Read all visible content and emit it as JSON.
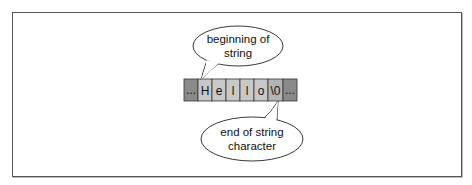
{
  "diagram": {
    "array_cells": [
      {
        "label": "...",
        "kind": "outside",
        "fill": "#8a8a8a"
      },
      {
        "label": "H",
        "kind": "char",
        "fill": "#c8c8c8"
      },
      {
        "label": "e",
        "kind": "char",
        "fill": "#c8c8c8"
      },
      {
        "label": "l",
        "kind": "char",
        "fill": "#c8c8c8"
      },
      {
        "label": "l",
        "kind": "char",
        "fill": "#c8c8c8"
      },
      {
        "label": "o",
        "kind": "char",
        "fill": "#c8c8c8"
      },
      {
        "label": "\\0",
        "kind": "terminator",
        "fill": "#b0b0b0"
      },
      {
        "label": "...",
        "kind": "outside",
        "fill": "#8a8a8a"
      }
    ],
    "callouts": {
      "top": {
        "line1": "beginning of",
        "line2": "string"
      },
      "bottom": {
        "line1": "end of string",
        "line2": "character"
      }
    }
  }
}
